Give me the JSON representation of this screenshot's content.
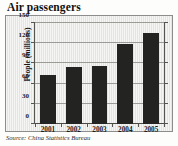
{
  "chart_data": {
    "type": "bar",
    "title": "Air passengers",
    "xlabel": "",
    "ylabel": "People (millions)",
    "categories": [
      "2001",
      "2002",
      "2003",
      "2004",
      "2005"
    ],
    "values": [
      73,
      85,
      86,
      119,
      135
    ],
    "ylim": [
      0,
      150
    ],
    "yticks": [
      0,
      30,
      60,
      90,
      120,
      150
    ],
    "ytick_labels": [
      "0",
      "30",
      "60",
      "90",
      "120",
      "150"
    ],
    "grid": true,
    "legend": "none",
    "bar_color": "#232322",
    "plot_background": "#e9e9e6",
    "source": "Source: China Statistics Bureau"
  }
}
